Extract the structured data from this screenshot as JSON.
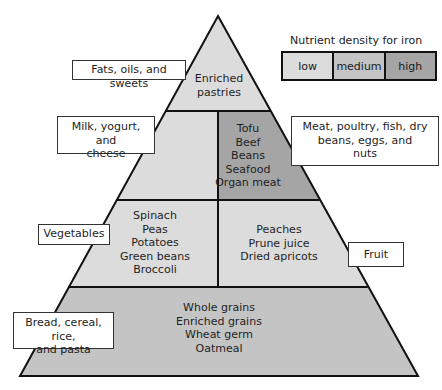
{
  "diagram": {
    "type": "food-pyramid",
    "colors": {
      "low": "#dcdcdc",
      "medium": "#c4c4c4",
      "high": "#a5a5a5",
      "outline": "#111111"
    }
  },
  "legend": {
    "title": "Nutrient density for iron",
    "items": [
      {
        "label": "low",
        "color": "#dcdcdc"
      },
      {
        "label": "medium",
        "color": "#c4c4c4"
      },
      {
        "label": "high",
        "color": "#a5a5a5"
      }
    ]
  },
  "tiers": {
    "fats": {
      "group_label": "Fats, oils, and sweets",
      "foods": [
        "Enriched",
        "pastries"
      ],
      "density": "low"
    },
    "milk": {
      "group_label_lines": [
        "Milk, yogurt, and",
        "cheese"
      ],
      "foods": [],
      "density": "low"
    },
    "meat": {
      "group_label_lines": [
        "Meat, poultry, fish, dry",
        "beans, eggs, and",
        "nuts"
      ],
      "foods": [
        "Tofu",
        "Beef",
        "Beans",
        "Seafood",
        "Organ meat"
      ],
      "density": "high"
    },
    "vegetables": {
      "group_label": "Vegetables",
      "foods": [
        "Spinach",
        "Peas",
        "Potatoes",
        "Green beans",
        "Broccoli"
      ],
      "density": "low"
    },
    "fruit": {
      "group_label": "Fruit",
      "foods": [
        "Peaches",
        "Prune juice",
        "Dried apricots"
      ],
      "density": "low"
    },
    "grains": {
      "group_label_lines": [
        "Bread, cereal, rice,",
        "and pasta"
      ],
      "foods": [
        "Whole grains",
        "Enriched grains",
        "Wheat germ",
        "Oatmeal"
      ],
      "density": "medium"
    }
  }
}
